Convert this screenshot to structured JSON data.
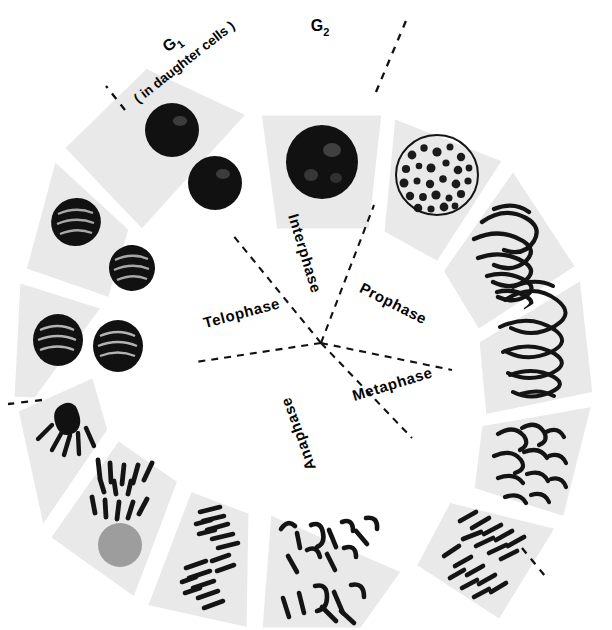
{
  "figure": {
    "type": "cell-cycle-wheel",
    "background_color": "#ffffff",
    "panel_color": "#e9e9e9",
    "ink_color": "#111111",
    "center": {
      "x": 321,
      "y": 343
    },
    "inner_radius": 112,
    "outer_radius": 300
  },
  "center_labels": [
    {
      "key": "interphase",
      "text": "Interphase",
      "angle_deg": -75,
      "radius": 150,
      "rotation": 73
    },
    {
      "key": "prophase",
      "text": "Prophase",
      "angle_deg": -27,
      "radius": 150,
      "rotation": 27
    },
    {
      "key": "metaphase",
      "text": "Metaphase",
      "angle_deg": 14,
      "radius": 152,
      "rotation": -17
    },
    {
      "key": "anaphase",
      "text": "Anaphase",
      "angle_deg": 70,
      "radius": 150,
      "rotation": -110
    },
    {
      "key": "telophase",
      "text": "Telophase",
      "angle_deg": 200,
      "radius": 150,
      "rotation": -15
    }
  ],
  "outer_labels": [
    {
      "key": "g2",
      "text": "G",
      "subscript": "2",
      "note": "",
      "x": 320,
      "y": 28,
      "rotation": 0
    },
    {
      "key": "g1",
      "text": "G",
      "subscript": "1",
      "note": "( in daughter cells )",
      "x": 175,
      "y": 47,
      "rotation": -38
    }
  ],
  "wedges": [
    {
      "index": 0,
      "stage": "interphase-g2",
      "content": "dense dark round nucleus",
      "cells": 1
    },
    {
      "index": 1,
      "stage": "early-prophase",
      "content": "granular condensing nucleus",
      "cells": 1
    },
    {
      "index": 2,
      "stage": "mid-prophase",
      "content": "coiled thread chromosomes",
      "cells": 1
    },
    {
      "index": 3,
      "stage": "late-prophase",
      "content": "thick coiled chromosomes",
      "cells": 1
    },
    {
      "index": 4,
      "stage": "prometaphase",
      "content": "distinct bent chromosomes",
      "cells": 1
    },
    {
      "index": 5,
      "stage": "metaphase",
      "content": "chromosomes aligned at plate",
      "cells": 2
    },
    {
      "index": 6,
      "stage": "early-anaphase",
      "content": "chromosomes beginning to part",
      "cells": 2
    },
    {
      "index": 7,
      "stage": "mid-anaphase",
      "content": "two separating chromosome sets",
      "cells": 2
    },
    {
      "index": 8,
      "stage": "late-anaphase",
      "content": "chromosome sets far apart",
      "cells": 2
    },
    {
      "index": 9,
      "stage": "early-telophase",
      "content": "two chromosome clusters",
      "cells": 2
    },
    {
      "index": 10,
      "stage": "telophase",
      "content": "two reforming nuclei",
      "cells": 2
    },
    {
      "index": 11,
      "stage": "late-telophase",
      "content": "two compact daughter nuclei",
      "cells": 2
    },
    {
      "index": 12,
      "stage": "g1-daughter-cells",
      "content": "two dark interphase nuclei",
      "cells": 2
    }
  ]
}
